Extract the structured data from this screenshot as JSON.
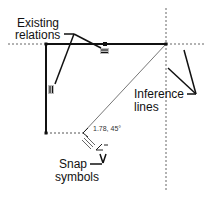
{
  "callouts": {
    "existing_relations": [
      "Existing",
      "relations"
    ],
    "inference_lines": [
      "Inference",
      "lines"
    ],
    "snap_symbols": [
      "Snap",
      "symbols"
    ]
  },
  "dimension_readout": "1.78, 45°",
  "relation_icons": [
    {
      "name": "horizontal-relation-icon",
      "glyph": "="
    },
    {
      "name": "vertical-relation-icon",
      "glyph": "||"
    }
  ],
  "snap_icons": [
    "angle-snap-icon",
    "parallel-snap-icon",
    "vertical-snap-icon"
  ],
  "colors": {
    "solid_line": "#111111",
    "inference_line": "#666666",
    "icon_fill": "#bbbbbb"
  }
}
